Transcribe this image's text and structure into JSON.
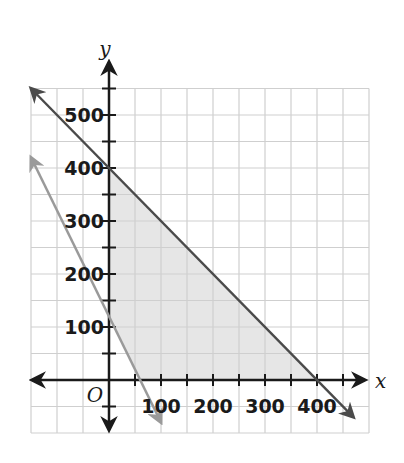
{
  "chart_data": {
    "type": "line",
    "title": "",
    "xlabel": "x",
    "ylabel": "y",
    "origin_label": "O",
    "xlim": [
      -150,
      500
    ],
    "ylim": [
      -100,
      550
    ],
    "grid": true,
    "grid_step": 50,
    "x_ticks": [
      100,
      200,
      300,
      400
    ],
    "y_ticks": [
      100,
      200,
      300,
      400,
      500
    ],
    "x_tick_labels": [
      "100",
      "200",
      "300",
      "400"
    ],
    "y_tick_labels": [
      "100",
      "200",
      "300",
      "400",
      "500"
    ],
    "series": [
      {
        "name": "boundary-line-dark",
        "color": "#4a4a4a",
        "points": [
          [
            -150,
            550
          ],
          [
            0,
            400
          ],
          [
            400,
            0
          ],
          [
            470,
            -70
          ]
        ],
        "equation": "x + y = 400"
      },
      {
        "name": "boundary-line-light",
        "color": "#9a9a9a",
        "points": [
          [
            -150,
            420
          ],
          [
            0,
            120
          ],
          [
            60,
            0
          ],
          [
            100,
            -80
          ]
        ],
        "equation": "approx 2x + y = 120"
      }
    ],
    "shaded_region": {
      "color": "#e6e6e6",
      "vertices": [
        [
          0,
          120
        ],
        [
          0,
          400
        ],
        [
          400,
          0
        ],
        [
          60,
          0
        ]
      ]
    }
  }
}
